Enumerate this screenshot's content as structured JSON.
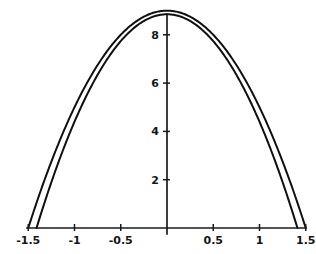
{
  "chart_data": {
    "type": "line",
    "title": "",
    "subtitle": "",
    "xlabel": "",
    "ylabel": "",
    "xlim": [
      -1.62,
      1.62
    ],
    "ylim": [
      -0.35,
      9.4
    ],
    "grid": false,
    "legend": "none",
    "background": "#ffffff",
    "axis_color": "#1a1a1a",
    "curve_color": "#101010",
    "xticks": [
      -1.5,
      -1,
      -0.5,
      0.5,
      1,
      1.5
    ],
    "xtick_labels": [
      "-1.5",
      "-1",
      "-0.5",
      "0.5",
      "1",
      "1.5"
    ],
    "yticks": [
      2,
      4,
      6,
      8
    ],
    "ytick_labels": [
      "2",
      "4",
      "6",
      "8"
    ],
    "annotations": [],
    "series": [
      {
        "name": "outer-parabola",
        "kind": "parabola",
        "vertex": [
          0,
          9.0
        ],
        "roots": [
          -1.5,
          1.5
        ],
        "coefficient": -4.0,
        "x": [
          -1.5,
          -1.4,
          -1.3,
          -1.2,
          -1.1,
          -1.0,
          -0.9,
          -0.8,
          -0.7,
          -0.6,
          -0.5,
          -0.4,
          -0.3,
          -0.2,
          -0.1,
          0,
          0.1,
          0.2,
          0.3,
          0.4,
          0.5,
          0.6,
          0.7,
          0.8,
          0.9,
          1.0,
          1.1,
          1.2,
          1.3,
          1.4,
          1.5
        ],
        "values": [
          0,
          1.16,
          2.24,
          3.24,
          4.16,
          5.0,
          5.76,
          6.44,
          7.04,
          7.56,
          8.0,
          8.36,
          8.64,
          8.84,
          8.96,
          9.0,
          8.96,
          8.84,
          8.64,
          8.36,
          8.0,
          7.56,
          7.04,
          6.44,
          5.76,
          5.0,
          4.16,
          3.24,
          2.24,
          1.16,
          0
        ]
      },
      {
        "name": "inner-parabola",
        "kind": "parabola",
        "vertex": [
          0,
          8.85
        ],
        "roots": [
          -1.41,
          1.41
        ],
        "coefficient": -4.45,
        "x": [
          -1.41,
          -1.3,
          -1.2,
          -1.1,
          -1.0,
          -0.9,
          -0.8,
          -0.7,
          -0.6,
          -0.5,
          -0.4,
          -0.3,
          -0.2,
          -0.1,
          0,
          0.1,
          0.2,
          0.3,
          0.4,
          0.5,
          0.6,
          0.7,
          0.8,
          0.9,
          1.0,
          1.1,
          1.2,
          1.3,
          1.41
        ],
        "values": [
          0,
          1.33,
          2.44,
          3.47,
          4.4,
          5.25,
          6.0,
          6.67,
          7.25,
          7.74,
          8.14,
          8.45,
          8.67,
          8.81,
          8.85,
          8.81,
          8.67,
          8.45,
          8.14,
          7.74,
          7.25,
          6.67,
          6.0,
          5.25,
          4.4,
          3.47,
          2.44,
          1.33,
          0
        ]
      }
    ]
  }
}
